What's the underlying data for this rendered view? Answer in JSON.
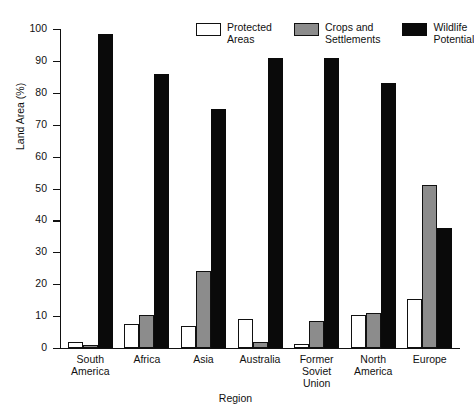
{
  "chart_data": {
    "type": "bar",
    "title": "",
    "xlabel": "Region",
    "ylabel": "Land Area (%)",
    "ylim": [
      0,
      100
    ],
    "ytick_step": 10,
    "yticks": [
      100,
      90,
      80,
      70,
      60,
      50,
      40,
      30,
      20,
      10,
      0
    ],
    "grid": false,
    "legend_position": "top-right",
    "categories": [
      "South\nAmerica",
      "Africa",
      "Asia",
      "Australia",
      "Former\nSoviet\nUnion",
      "North\nAmerica",
      "Europe"
    ],
    "series": [
      {
        "name": "Protected\nAreas",
        "color": "#ffffff",
        "values": [
          2,
          7.5,
          7,
          9,
          1.2,
          10.5,
          15.5
        ]
      },
      {
        "name": "Crops and\nSettlements",
        "color": "#8c8c8c",
        "values": [
          1,
          10.5,
          24,
          2,
          8.5,
          11,
          51
        ]
      },
      {
        "name": "Wildlife\nPotential",
        "color": "#0a0a0a",
        "values": [
          98.5,
          86,
          75,
          91,
          91,
          83,
          37.5
        ]
      }
    ]
  },
  "artifacts": {
    "bleed_top": "",
    "bleed_1": "",
    "bleed_2": "",
    "bleed_3": "",
    "bleed_4": "",
    "bleed_5": ""
  }
}
